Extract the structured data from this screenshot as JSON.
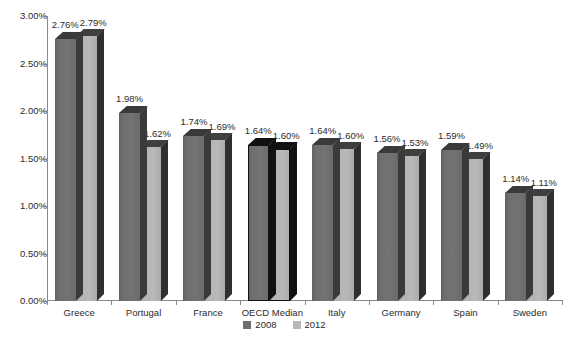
{
  "chart_data": {
    "type": "bar",
    "title": "",
    "subtitle": "",
    "xlabel": "",
    "ylabel": "",
    "categories": [
      "Greece",
      "Portugal",
      "France",
      "OECD Median",
      "Italy",
      "Germany",
      "Spain",
      "Sweden"
    ],
    "series": [
      {
        "name": "2008",
        "color": "#6e6e6e",
        "values": [
          2.76,
          1.98,
          1.74,
          1.64,
          1.64,
          1.56,
          1.59,
          1.14
        ],
        "labels": [
          "2.76%",
          "1.98%",
          "1.74%",
          "1.64%",
          "1.64%",
          "1.56%",
          "1.59%",
          "1.14%"
        ]
      },
      {
        "name": "2012",
        "color": "#b6b6b6",
        "values": [
          2.79,
          1.62,
          1.69,
          1.6,
          1.6,
          1.53,
          1.49,
          1.11
        ],
        "labels": [
          "2.79%",
          "1.62%",
          "1.69%",
          "1.60%",
          "1.60%",
          "1.53%",
          "1.49%",
          "1.11%"
        ]
      }
    ],
    "highlight_category": "OECD Median",
    "ylim": [
      0,
      3.0
    ],
    "ytick_values": [
      0,
      0.5,
      1.0,
      1.5,
      2.0,
      2.5,
      3.0
    ],
    "ytick_labels": [
      "0.00%",
      "0.50%",
      "1.00%",
      "1.50%",
      "2.00%",
      "2.50%",
      "3.00%"
    ],
    "grid": false,
    "legend_position": "bottom",
    "value_labels_shown": true,
    "style": "3d-column"
  },
  "legend": {
    "items": [
      {
        "label": "2008",
        "color": "#6e6e6e"
      },
      {
        "label": "2012",
        "color": "#b6b6b6"
      }
    ]
  },
  "axis": {
    "y_labels": [
      "3.00%",
      "2.50%",
      "2.00%",
      "1.50%",
      "1.00%",
      "0.50%",
      "0.00%"
    ],
    "x_labels": [
      "Greece",
      "Portugal",
      "France",
      "OECD Median",
      "Italy",
      "Germany",
      "Spain",
      "Sweden"
    ]
  },
  "colors": {
    "series_2008": "#6e6e6e",
    "series_2012": "#b6b6b6",
    "shadow": "#2e2e2e",
    "axis": "#8a8a8a",
    "text": "#2b2b2b",
    "background": "#ffffff",
    "highlight_outline": "#111111"
  }
}
